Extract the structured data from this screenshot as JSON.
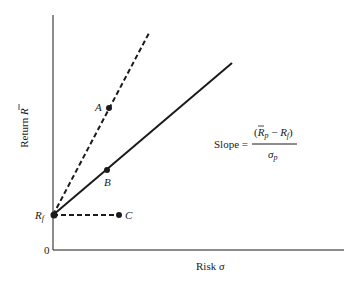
{
  "figure": {
    "type": "diagram",
    "colors": {
      "ink": "#1a1a1a",
      "background": "#ffffff"
    },
    "axes": {
      "y_label": "Return R̄",
      "y_label_text": "Return ",
      "y_label_symbol": "R",
      "x_label": "Risk σ",
      "x_label_text": "Risk ",
      "x_label_symbol": "σ",
      "origin_label": "0"
    },
    "points": {
      "rf": {
        "label": "R",
        "subscript": "f"
      },
      "a": {
        "label": "A"
      },
      "b": {
        "label": "B"
      },
      "c": {
        "label": "C"
      }
    },
    "lines": [
      {
        "name": "rf-to-a",
        "style": "dashed",
        "through": "A"
      },
      {
        "name": "rf-to-b",
        "style": "solid",
        "through": "B"
      },
      {
        "name": "rf-to-c",
        "style": "dashed",
        "ends_at": "C"
      }
    ],
    "formula": {
      "lhs": "Slope =",
      "numerator_open": "(",
      "numerator_r": "R",
      "numerator_sub_p": "p",
      "numerator_minus": " − ",
      "numerator_rf": "R",
      "numerator_sub_f": "f",
      "numerator_close": ")",
      "denominator": "σ",
      "denominator_sub": "p",
      "text": "Slope = (R̄p − Rf) / σp"
    }
  }
}
